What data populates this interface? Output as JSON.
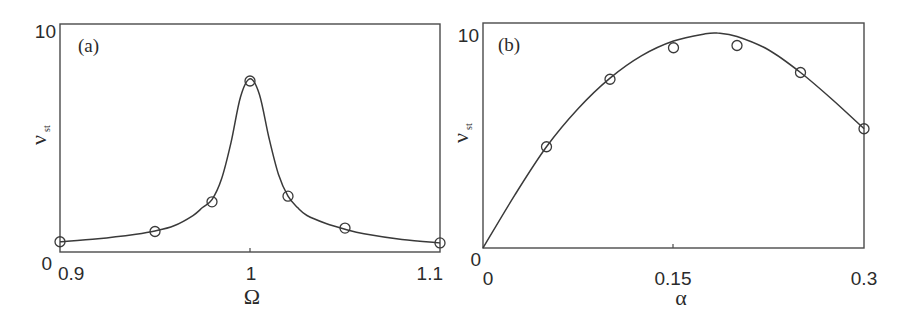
{
  "chart_data": [
    {
      "type": "line",
      "panel_label": "(a)",
      "title": "",
      "xlabel": "Ω",
      "ylabel": "ν",
      "ylabel_subscript": "st",
      "xlim": [
        0.9,
        1.1
      ],
      "ylim": [
        0,
        10
      ],
      "xticks": [
        "0.9",
        "1",
        "1.1"
      ],
      "yticks": [
        "0",
        "10"
      ],
      "grid": false,
      "series": [
        {
          "name": "simulation (markers)",
          "style": "open-circle",
          "x": [
            0.9,
            0.95,
            0.98,
            1.0,
            1.02,
            1.05,
            1.1
          ],
          "y": [
            0.45,
            0.9,
            2.2,
            7.5,
            2.45,
            1.05,
            0.4
          ]
        },
        {
          "name": "theory (curve)",
          "style": "solid-line",
          "x": [
            0.9,
            0.92,
            0.94,
            0.95,
            0.96,
            0.97,
            0.975,
            0.98,
            0.985,
            0.99,
            0.995,
            1.0,
            1.005,
            1.01,
            1.015,
            1.02,
            1.025,
            1.03,
            1.04,
            1.05,
            1.06,
            1.08,
            1.1
          ],
          "y": [
            0.45,
            0.58,
            0.78,
            0.92,
            1.15,
            1.6,
            1.95,
            2.3,
            3.2,
            4.8,
            6.8,
            7.6,
            6.9,
            5.0,
            3.4,
            2.45,
            1.95,
            1.6,
            1.25,
            1.0,
            0.8,
            0.55,
            0.4
          ]
        }
      ]
    },
    {
      "type": "line",
      "panel_label": "(b)",
      "title": "",
      "xlabel": "α",
      "ylabel": "ν",
      "ylabel_subscript": "st",
      "xlim": [
        0,
        0.3
      ],
      "ylim": [
        0,
        10
      ],
      "xticks": [
        "0",
        "0.15",
        "0.3"
      ],
      "yticks": [
        "0",
        "10"
      ],
      "grid": false,
      "series": [
        {
          "name": "simulation (markers)",
          "style": "open-circle",
          "x": [
            0.05,
            0.1,
            0.15,
            0.2,
            0.25,
            0.3
          ],
          "y": [
            4.5,
            7.5,
            8.9,
            9.0,
            7.8,
            5.3
          ]
        },
        {
          "name": "theory (curve)",
          "style": "solid-line",
          "x": [
            0.0,
            0.025,
            0.05,
            0.075,
            0.1,
            0.125,
            0.15,
            0.175,
            0.185,
            0.2,
            0.225,
            0.25,
            0.275,
            0.3
          ],
          "y": [
            0.0,
            2.35,
            4.5,
            6.2,
            7.55,
            8.55,
            9.2,
            9.52,
            9.55,
            9.4,
            8.8,
            7.8,
            6.6,
            5.3
          ]
        }
      ]
    }
  ]
}
